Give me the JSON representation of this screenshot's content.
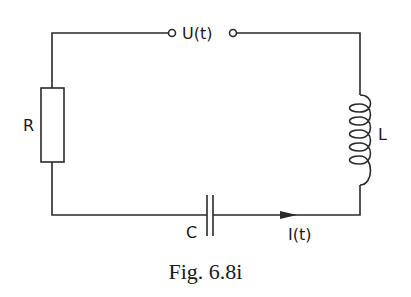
{
  "figure": {
    "caption": "Fig. 6.8i",
    "type": "RLC series circuit"
  },
  "components": {
    "source": {
      "label": "U(t)",
      "kind": "voltage-source-terminals"
    },
    "resistor": {
      "label": "R"
    },
    "inductor": {
      "label": "L",
      "turns": 5
    },
    "capacitor": {
      "label": "C"
    },
    "current": {
      "label": "I(t)",
      "direction": "right"
    }
  },
  "colors": {
    "line": "#2a2a2a",
    "background": "#ffffff"
  }
}
